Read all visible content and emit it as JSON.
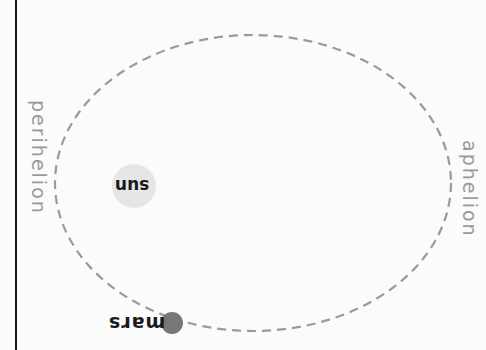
{
  "diagram": {
    "title": "",
    "labels": {
      "perihelion": "perihelion",
      "aphelion": "aphelion",
      "sun": "sun",
      "mars": "mars"
    },
    "orbit": {
      "shape": "ellipse",
      "stroke": "dashed",
      "color": "#999999",
      "center": [
        253,
        183
      ],
      "rx": 198,
      "ry": 148
    },
    "bodies": [
      {
        "name": "sun",
        "center": [
          134,
          186
        ],
        "radius": 22,
        "color": "#e6e6e6"
      },
      {
        "name": "mars",
        "center": [
          172,
          323
        ],
        "radius": 11,
        "color": "#777777"
      }
    ],
    "colors": {
      "background": "#fbfbfb",
      "rule": "#1a1a1a",
      "label_gray": "#9a9a9a",
      "label_dark": "#1a1a1a"
    }
  }
}
